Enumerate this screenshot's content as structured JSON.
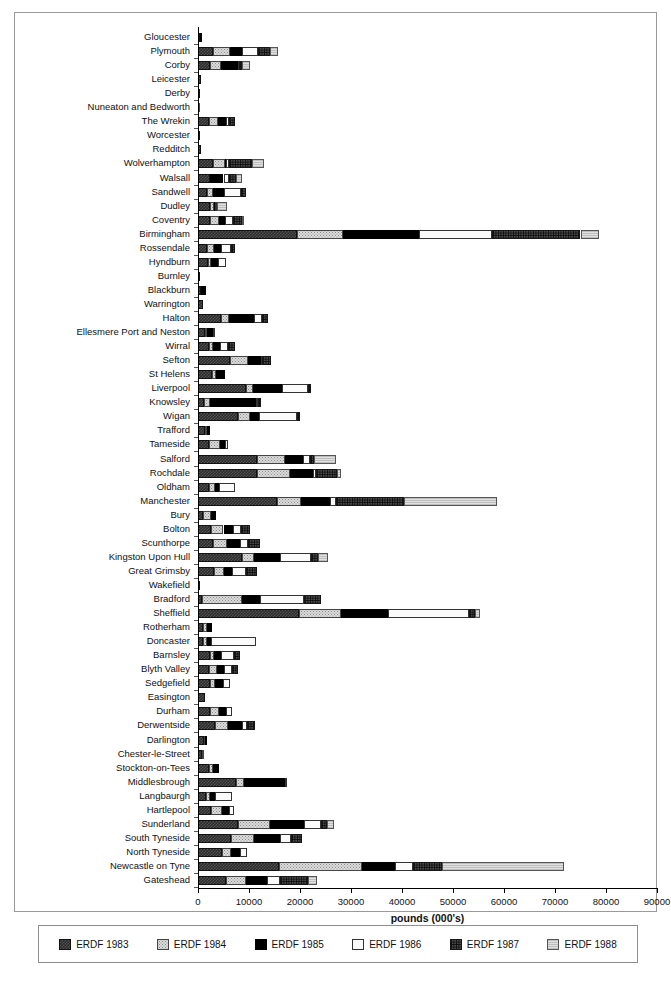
{
  "top_bleed_text": "",
  "chart_data": {
    "type": "bar",
    "subtype": "horizontal-stacked",
    "title": "",
    "xlabel": "pounds (000's)",
    "ylabel": "",
    "xlim": [
      0,
      90000
    ],
    "xticks": [
      0,
      10000,
      20000,
      30000,
      40000,
      50000,
      60000,
      70000,
      80000,
      90000
    ],
    "xtick_labels": [
      "0",
      "10000",
      "20000",
      "30000",
      "40000",
      "50000",
      "60000",
      "70000",
      "80000",
      "90000"
    ],
    "grid": false,
    "legend_position": "below-axis",
    "series": [
      {
        "name": "ERDF 1983",
        "pattern": "dark-checker"
      },
      {
        "name": "ERDF 1984",
        "pattern": "light-stipple"
      },
      {
        "name": "ERDF 1985",
        "pattern": "solid-black"
      },
      {
        "name": "ERDF 1986",
        "pattern": "white"
      },
      {
        "name": "ERDF 1987",
        "pattern": "dense-dark-weave"
      },
      {
        "name": "ERDF 1988",
        "pattern": "light-grey"
      }
    ],
    "categories": [
      "Gloucester",
      "Plymouth",
      "Corby",
      "Leicester",
      "Derby",
      "Nuneaton and Bedworth",
      "The Wrekin",
      "Worcester",
      "Redditch",
      "Wolverhampton",
      "Walsall",
      "Sandwell",
      "Dudley",
      "Coventry",
      "Birmingham",
      "Rossendale",
      "Hyndburn",
      "Burnley",
      "Blackburn",
      "Warrington",
      "Halton",
      "Ellesmere Port and Neston",
      "Wirral",
      "Sefton",
      "St Helens",
      "Liverpool",
      "Knowsley",
      "Wigan",
      "Trafford",
      "Tameside",
      "Salford",
      "Rochdale",
      "Oldham",
      "Manchester",
      "Bury",
      "Bolton",
      "Scunthorpe",
      "Kingston Upon Hull",
      "Great Grimsby",
      "Wakefield",
      "Bradford",
      "Sheffield",
      "Rotherham",
      "Doncaster",
      "Barnsley",
      "Blyth Valley",
      "Sedgefield",
      "Easington",
      "Durham",
      "Derwentside",
      "Darlington",
      "Chester-le-Street",
      "Stockton-on-Tees",
      "Middlesbrough",
      "Langbaurgh",
      "Hartlepool",
      "Sunderland",
      "South Tyneside",
      "North Tyneside",
      "Newcastle on Tyne",
      "Gateshead"
    ],
    "stacks": [
      [
        300,
        0,
        350,
        0,
        0,
        0
      ],
      [
        2900,
        3300,
        2400,
        3100,
        2500,
        1500
      ],
      [
        2400,
        2200,
        3200,
        300,
        500,
        1600
      ],
      [
        600,
        0,
        0,
        0,
        0,
        0
      ],
      [
        100,
        0,
        0,
        0,
        0,
        0
      ],
      [
        0,
        400,
        0,
        0,
        0,
        0
      ],
      [
        2100,
        1900,
        1500,
        500,
        1300,
        0
      ],
      [
        200,
        0,
        0,
        0,
        0,
        0
      ],
      [
        600,
        0,
        0,
        0,
        0,
        0
      ],
      [
        3000,
        2200,
        300,
        600,
        4500,
        2300
      ],
      [
        2400,
        0,
        2600,
        1100,
        1400,
        1100
      ],
      [
        1800,
        1100,
        2200,
        3300,
        1000,
        0
      ],
      [
        2300,
        900,
        200,
        300,
        0,
        1900
      ],
      [
        2300,
        1800,
        1100,
        1600,
        1800,
        400
      ],
      [
        19400,
        9000,
        14900,
        14300,
        17400,
        3600
      ],
      [
        1700,
        1400,
        1500,
        1900,
        800,
        0
      ],
      [
        2000,
        500,
        1400,
        1500,
        0,
        0
      ],
      [
        100,
        0,
        0,
        0,
        0,
        0
      ],
      [
        600,
        0,
        900,
        0,
        0,
        0
      ],
      [
        900,
        0,
        0,
        0,
        0,
        0
      ],
      [
        4600,
        1400,
        4900,
        1700,
        1200,
        0
      ],
      [
        1300,
        500,
        1100,
        500,
        0,
        0
      ],
      [
        2200,
        800,
        1400,
        1500,
        1400,
        0
      ],
      [
        6300,
        3600,
        2400,
        300,
        1700,
        0
      ],
      [
        2700,
        800,
        1700,
        0,
        0,
        0
      ],
      [
        9500,
        1200,
        5700,
        5200,
        600,
        0
      ],
      [
        1100,
        1300,
        8900,
        400,
        600,
        0
      ],
      [
        7900,
        2300,
        1700,
        7600,
        500,
        0
      ],
      [
        1300,
        400,
        600,
        0,
        0,
        0
      ],
      [
        2200,
        2200,
        900,
        500,
        0,
        0
      ],
      [
        11600,
        5500,
        3500,
        1400,
        700,
        4400
      ],
      [
        11500,
        6600,
        4400,
        700,
        4100,
        800
      ],
      [
        2100,
        1300,
        800,
        3000,
        0,
        0
      ],
      [
        15500,
        4600,
        5800,
        1200,
        13200,
        18300
      ],
      [
        900,
        1700,
        900,
        0,
        0,
        0
      ],
      [
        2600,
        2400,
        1800,
        1700,
        1600,
        0
      ],
      [
        2900,
        2700,
        2600,
        1600,
        2400,
        0
      ],
      [
        8600,
        2300,
        5100,
        6100,
        1500,
        1800
      ],
      [
        3100,
        2000,
        1600,
        2800,
        2000,
        0
      ],
      [
        300,
        0,
        0,
        0,
        0,
        0
      ],
      [
        800,
        7900,
        3500,
        8600,
        3400,
        0
      ],
      [
        19800,
        8200,
        9200,
        16000,
        1200,
        900
      ],
      [
        900,
        900,
        900,
        0,
        0,
        0
      ],
      [
        1000,
        700,
        800,
        8900,
        0,
        0
      ],
      [
        2300,
        900,
        1400,
        2400,
        1300,
        0
      ],
      [
        2200,
        1600,
        1300,
        1600,
        1200,
        0
      ],
      [
        2300,
        1000,
        1600,
        1300,
        0,
        0
      ],
      [
        1400,
        0,
        0,
        0,
        0,
        0
      ],
      [
        2400,
        1700,
        1300,
        1200,
        0,
        0
      ],
      [
        3300,
        2600,
        2800,
        900,
        1600,
        0
      ],
      [
        1100,
        300,
        400,
        0,
        0,
        0
      ],
      [
        700,
        200,
        0,
        0,
        0,
        0
      ],
      [
        2100,
        900,
        1100,
        0,
        0,
        0
      ],
      [
        7400,
        1700,
        7900,
        500,
        0,
        0
      ],
      [
        1600,
        800,
        900,
        3400,
        0,
        0
      ],
      [
        2500,
        2200,
        1400,
        900,
        0,
        0
      ],
      [
        7800,
        6400,
        6600,
        3400,
        1100,
        1300
      ],
      [
        6500,
        4500,
        5100,
        2100,
        2200,
        0
      ],
      [
        4700,
        1800,
        1800,
        1400,
        0,
        0
      ],
      [
        15900,
        16300,
        6400,
        3600,
        5700,
        23800
      ],
      [
        5400,
        4000,
        4200,
        2400,
        5500,
        1900
      ]
    ]
  }
}
